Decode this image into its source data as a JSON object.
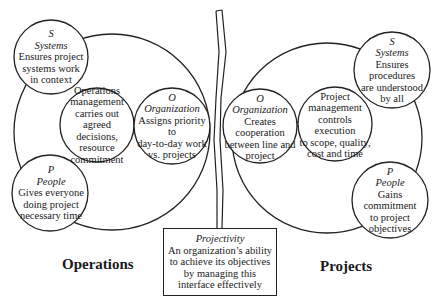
{
  "diagram": {
    "operations": {
      "title": "Operations",
      "systems": {
        "letter": "S",
        "name": "Systems",
        "lines": [
          "Ensures project",
          "systems work",
          "in context"
        ]
      },
      "people": {
        "letter": "P",
        "name": "People",
        "lines": [
          "Gives everyone",
          "doing project",
          "necessary time"
        ]
      },
      "organization": {
        "letter": "O",
        "name": "Organization",
        "lines": [
          "Assigns priority to",
          "day-to-day work",
          "vs. projects"
        ]
      },
      "center": {
        "lines": [
          "Operations",
          "management",
          "carries out agreed",
          "decisions, resource",
          "commitment"
        ]
      }
    },
    "projects": {
      "title": "Projects",
      "systems": {
        "letter": "S",
        "name": "Systems",
        "lines": [
          "Ensures procedures",
          "are understood",
          "by all"
        ]
      },
      "people": {
        "letter": "P",
        "name": "People",
        "lines": [
          "Gains",
          "commitment",
          "to project",
          "objectives"
        ]
      },
      "organization": {
        "letter": "O",
        "name": "Organization",
        "lines": [
          "Creates",
          "cooperation",
          "between line and",
          "project"
        ]
      },
      "center": {
        "lines": [
          "Project",
          "management",
          "controls execution",
          "to scope, quality,",
          "cost and time"
        ]
      }
    },
    "interface": {
      "name": "Projectivity",
      "lines": [
        "An organization’s ability",
        "to achieve its objectives",
        "by managing this",
        "interface effectively"
      ]
    },
    "colors": {
      "stroke": "#222222",
      "background": "#ffffff",
      "text": "#1a1a1a"
    }
  }
}
